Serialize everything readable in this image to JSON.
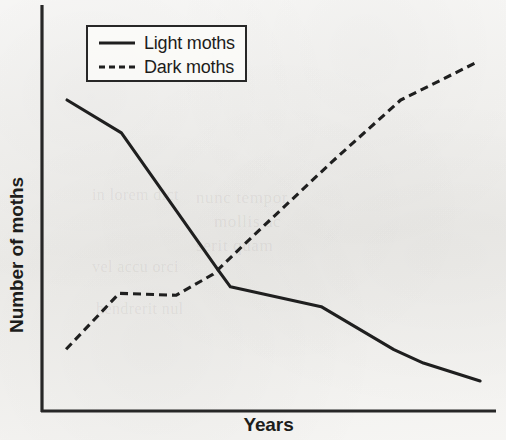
{
  "chart_data": {
    "type": "line",
    "title": "",
    "xlabel": "Years",
    "ylabel": "Number of moths",
    "xlim": [
      0,
      100
    ],
    "ylim": [
      0,
      100
    ],
    "grid": false,
    "axis_ticks": false,
    "axis_tick_labels": false,
    "legend_position": "top-left",
    "series": [
      {
        "name": "Light moths",
        "style": "solid",
        "color": "#272727",
        "x": [
          5.5,
          17.5,
          39.0,
          41.5,
          61.5,
          77.5,
          84.0,
          96.5
        ],
        "y": [
          76.6,
          68.5,
          34.4,
          30.6,
          25.7,
          15.1,
          11.8,
          7.4
        ]
      },
      {
        "name": "Dark moths",
        "style": "dashed",
        "color": "#272727",
        "x": [
          5.3,
          17.0,
          29.5,
          37.7,
          44.6,
          63.8,
          79.0,
          95.4
        ],
        "y": [
          15.2,
          29.0,
          28.5,
          33.7,
          41.1,
          61.3,
          76.6,
          85.7
        ]
      }
    ],
    "annotations": [
      {
        "text": "Light-moth and dark-moth curves cross near the middle of the time axis",
        "x": 42.0,
        "y": 35.6
      }
    ]
  },
  "legend": {
    "entries": [
      {
        "label": "Light moths",
        "style": "solid"
      },
      {
        "label": "Dark moths",
        "style": "dashed"
      }
    ]
  },
  "axes": {
    "x_title": "Years",
    "y_title": "Number of moths",
    "axis_color": "#272727"
  },
  "page_bleed": {
    "line_1": "nunc tempor",
    "line_2": "mollis ac",
    "line_3": "serit quam",
    "line_4": "in lorem dict",
    "line_5": "vel accu orci",
    "line_6": "hendrerit nul"
  }
}
